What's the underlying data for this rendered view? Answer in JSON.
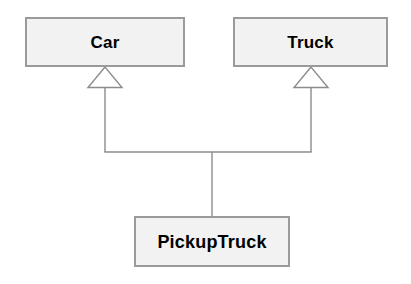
{
  "diagram": {
    "type": "uml-class-diagram",
    "background_color": "#ffffff",
    "classes": [
      {
        "id": "car",
        "name": "Car",
        "role": "superclass",
        "x": 25,
        "y": 17,
        "width": 160,
        "height": 50,
        "fill_color": "#f2f2f2",
        "border_color": "#9a9a9a"
      },
      {
        "id": "truck",
        "name": "Truck",
        "role": "superclass",
        "x": 233,
        "y": 17,
        "width": 155,
        "height": 50,
        "fill_color": "#f2f2f2",
        "border_color": "#9a9a9a"
      },
      {
        "id": "pickuptruck",
        "name": "PickupTruck",
        "role": "subclass",
        "x": 134,
        "y": 216,
        "width": 156,
        "height": 51,
        "fill_color": "#f2f2f2",
        "border_color": "#9a9a9a"
      }
    ],
    "relationships": [
      {
        "id": "pickup-inherits-car",
        "kind": "generalization",
        "from": "PickupTruck",
        "to": "Car",
        "arrowhead": "hollow-triangle",
        "line_color": "#8c8c8c"
      },
      {
        "id": "pickup-inherits-truck",
        "kind": "generalization",
        "from": "PickupTruck",
        "to": "Truck",
        "arrowhead": "hollow-triangle",
        "line_color": "#8c8c8c"
      }
    ]
  }
}
